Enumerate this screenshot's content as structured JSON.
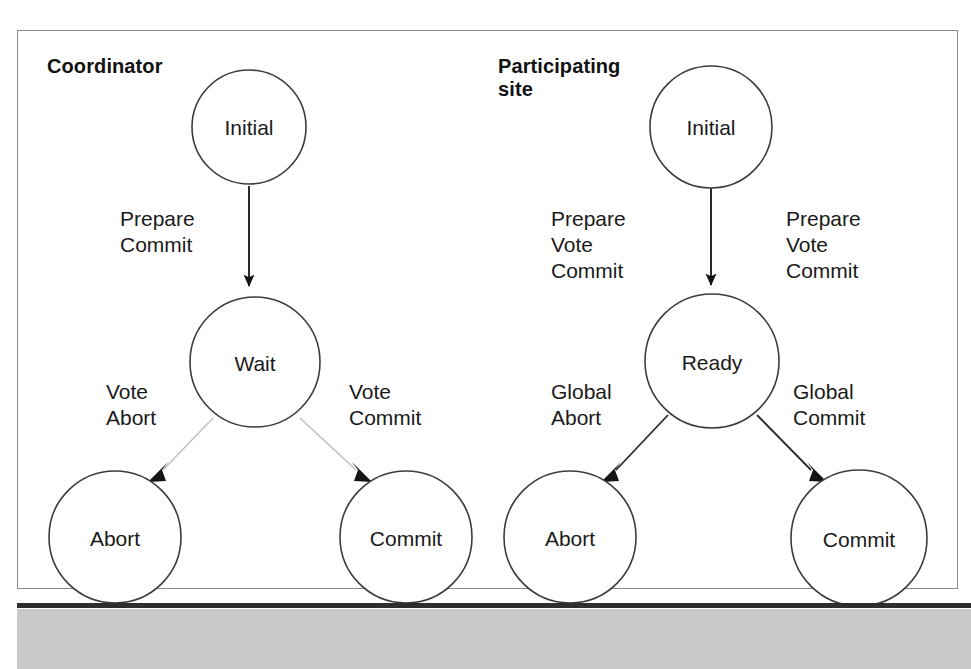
{
  "figure": {
    "type": "state-transition-diagram",
    "sections": [
      {
        "id": "coordinator",
        "title": "Coordinator",
        "nodes": [
          {
            "id": "coord-initial",
            "label": "Initial"
          },
          {
            "id": "coord-wait",
            "label": "Wait"
          },
          {
            "id": "coord-abort",
            "label": "Abort"
          },
          {
            "id": "coord-commit",
            "label": "Commit"
          }
        ],
        "edges": [
          {
            "id": "coord-initial-wait",
            "from": "Initial",
            "to": "Wait",
            "label": "Prepare\nCommit"
          },
          {
            "id": "coord-wait-abort",
            "from": "Wait",
            "to": "Abort",
            "label": "Vote\nAbort"
          },
          {
            "id": "coord-wait-commit",
            "from": "Wait",
            "to": "Commit",
            "label": "Vote\nCommit"
          }
        ]
      },
      {
        "id": "participating-site",
        "title": "Participating\nsite",
        "nodes": [
          {
            "id": "site-initial",
            "label": "Initial"
          },
          {
            "id": "site-ready",
            "label": "Ready"
          },
          {
            "id": "site-abort",
            "label": "Abort"
          },
          {
            "id": "site-commit",
            "label": "Commit"
          }
        ],
        "edges": [
          {
            "id": "site-initial-ready",
            "from": "Initial",
            "to": "Ready",
            "label": "Prepare\nVote\nCommit"
          },
          {
            "id": "site-initial-ready-right",
            "from": "Initial",
            "to": "Ready",
            "label": "Prepare\nVote\nCommit"
          },
          {
            "id": "site-ready-abort",
            "from": "Ready",
            "to": "Abort",
            "label": "Global\nAbort"
          },
          {
            "id": "site-ready-commit",
            "from": "Ready",
            "to": "Commit",
            "label": "Global\nCommit"
          }
        ]
      }
    ]
  },
  "colors": {
    "page_background": "#ffffff",
    "frame_border": "#8a8a8a",
    "node_stroke": "#3c3c3c",
    "text": "#1a1a1a",
    "arrow": "#1a1a1a",
    "faint_arrow": "#b9b9b9",
    "bottom_band": "#c9c9c9",
    "bottom_rule": "#2e2e2e"
  }
}
